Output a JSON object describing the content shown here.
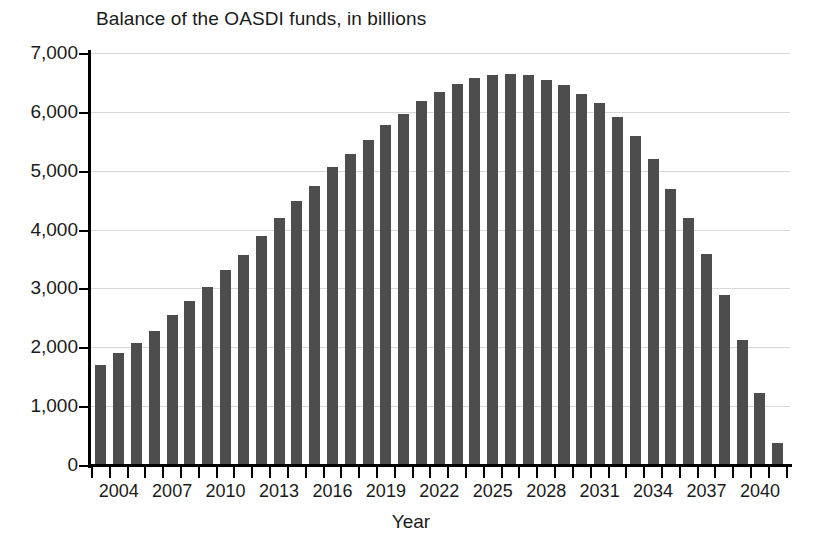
{
  "chart_data": {
    "type": "bar",
    "title": "Balance of the OASDI funds, in billions",
    "xlabel": "Year",
    "ylabel": "",
    "ylim": [
      0,
      7000
    ],
    "xlim": [
      2003,
      2041
    ],
    "grid": true,
    "legend": null,
    "bar_color": "#4d4d4d",
    "y_ticks": [
      7000,
      6000,
      5000,
      4000,
      3000,
      2000,
      1000,
      0
    ],
    "y_tick_labels": [
      "7,000",
      "6,000",
      "5,000",
      "4,000",
      "3,000",
      "2,000",
      "1,000",
      "0"
    ],
    "x_tick_labels": [
      "2004",
      "2007",
      "2010",
      "2013",
      "2016",
      "2019",
      "2022",
      "2025",
      "2028",
      "2031",
      "2034",
      "2037",
      "2040"
    ],
    "categories": [
      "2003",
      "2004",
      "2005",
      "2006",
      "2007",
      "2008",
      "2009",
      "2010",
      "2011",
      "2012",
      "2013",
      "2014",
      "2015",
      "2016",
      "2017",
      "2018",
      "2019",
      "2020",
      "2021",
      "2022",
      "2023",
      "2024",
      "2025",
      "2026",
      "2027",
      "2028",
      "2029",
      "2030",
      "2031",
      "2032",
      "2033",
      "2034",
      "2035",
      "2036",
      "2037",
      "2038",
      "2039",
      "2040",
      "2041"
    ],
    "values": [
      1700,
      1900,
      2080,
      2280,
      2550,
      2780,
      3030,
      3320,
      3570,
      3890,
      4190,
      4480,
      4740,
      5060,
      5280,
      5520,
      5780,
      5970,
      6180,
      6340,
      6470,
      6570,
      6630,
      6650,
      6620,
      6550,
      6450,
      6310,
      6150,
      5920,
      5590,
      5200,
      4690,
      4190,
      3580,
      2890,
      2130,
      1230,
      370
    ]
  }
}
